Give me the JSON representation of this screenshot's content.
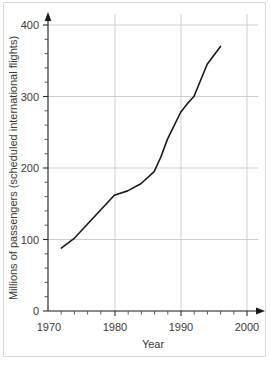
{
  "chart_data": {
    "type": "line",
    "title": "",
    "subtitle": "",
    "xlabel": "Year",
    "ylabel": "Millions of passengers (scheduled international flights)",
    "xlim": [
      1970,
      2000
    ],
    "ylim": [
      0,
      400
    ],
    "x_ticks": [
      1970,
      1980,
      1990,
      2000
    ],
    "x_tick_labels": [
      "1970",
      "1980",
      "1990",
      "2000"
    ],
    "x_minor_tick_step": 2,
    "y_ticks": [
      0,
      100,
      200,
      300,
      400
    ],
    "y_tick_labels": [
      "0",
      "100",
      "200",
      "300",
      "400"
    ],
    "y_minor_tick_step": 20,
    "grid": true,
    "grid_axes": "both",
    "grid_color": "#c9c9c9",
    "legend": false,
    "legend_position": "none",
    "line_color": "#1a1a1a",
    "axis_color": "#1a1a1a",
    "background_color": "#ffffff",
    "frame_color": "#d9d9d9",
    "axis_arrows": true,
    "series": [
      {
        "name": "Millions of passengers (scheduled international flights)",
        "x": [
          1972,
          1974,
          1976,
          1978,
          1980,
          1982,
          1984,
          1986,
          1987,
          1988,
          1990,
          1991,
          1992,
          1994,
          1996
        ],
        "values": [
          88,
          102,
          122,
          142,
          162,
          168,
          178,
          195,
          215,
          240,
          278,
          290,
          300,
          345,
          370
        ]
      }
    ]
  },
  "axis_labels": {
    "x_title": "Year",
    "y_title": "Millions of passengers (scheduled international flights)"
  }
}
